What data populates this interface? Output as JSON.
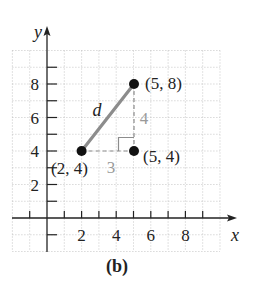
{
  "figure": {
    "caption": "(b)",
    "x_axis_label": "x",
    "y_axis_label": "y",
    "segment_label": "d",
    "horizontal_leg_label": "3",
    "vertical_leg_label": "4",
    "points": [
      {
        "label": "(2, 4)",
        "x": 2,
        "y": 4
      },
      {
        "label": "(5, 8)",
        "x": 5,
        "y": 8
      },
      {
        "label": "(5, 4)",
        "x": 5,
        "y": 4
      }
    ],
    "x_tick_labels": [
      "2",
      "4",
      "6",
      "8"
    ],
    "y_tick_labels": [
      "8",
      "6",
      "4",
      "2"
    ],
    "grid_range": {
      "xmin": -2,
      "xmax": 10,
      "ymin": -2,
      "ymax": 10
    },
    "colors": {
      "segment": "#8c8c8c",
      "dashed_legs": "#8c8c8c",
      "leg_labels": "#9a9a9a",
      "points": "#111111",
      "axes": "#222222",
      "grid": "#b8b8b8"
    }
  }
}
